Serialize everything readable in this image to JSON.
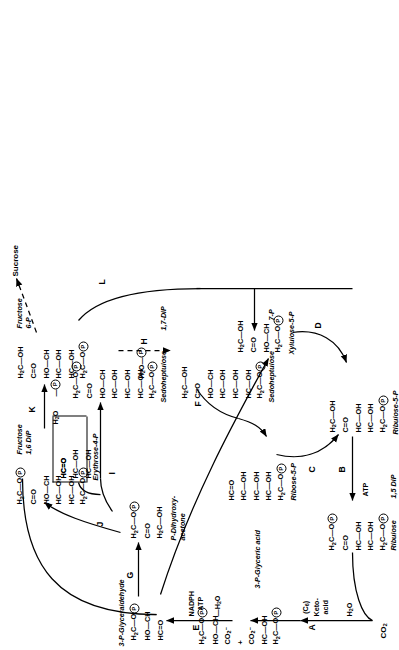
{
  "figure": {
    "orientation": "rotated-90-ccw"
  },
  "inputs": {
    "co2": "CO₂",
    "sucrose": "Sucrose"
  },
  "steps": {
    "a": "A",
    "b": "B",
    "c": "C",
    "d": "D",
    "e": "E",
    "f": "F",
    "g": "G",
    "h": "H",
    "i": "I",
    "j": "J",
    "k": "K",
    "l": "L"
  },
  "cofactors": {
    "a_intermediate": "(C₆)\nKeto-\nacid",
    "a_water": "H₂O",
    "b_atp": "ATP",
    "e_reductant": "NADPH\nATP",
    "e_water": "—H₂O",
    "h_water": "H₂O",
    "h_phosphate": "—Ⓟ",
    "k_water": "H₂O",
    "k_phosphate": "—Ⓟ"
  },
  "molecules": [
    {
      "id": "ribulose-1-5-dip",
      "name": "Ribulose\n1,5 DiP",
      "name_line1": "Ribulose",
      "name_line2": "1,5 DiP",
      "rows": [
        "H₂C—OⓅ",
        "C=O",
        "HC—OH",
        "HC—OH",
        "H₂C—OⓅ"
      ]
    },
    {
      "id": "3-p-glyceric-acid",
      "name": "3-P-Glyceric acid",
      "rows": [
        "H₂C—OⓅ",
        "HO—CH",
        "CO₂⁻",
        "+",
        "CO₂⁻",
        "HC—OH",
        "H₂C—OⓅ"
      ]
    },
    {
      "id": "3-p-glyceraldehyde",
      "name": "3-P-Glyceraldehyde",
      "rows": [
        "H₂C—OⓅ",
        "HO—CH",
        "HC=O"
      ]
    },
    {
      "id": "p-dihydroxyacetone",
      "name": "P-Dihydroxy-\nacetone",
      "name_line1": "P-Dihydroxy-",
      "name_line2": "acetone",
      "rows": [
        "H₂C—OⓅ",
        "C=O",
        "H₂C—OH"
      ]
    },
    {
      "id": "fructose-1-6-dip",
      "name": "Fructose\n1,6 DiP",
      "name_line1": "Fructose",
      "name_line2": "1,6 DiP",
      "rows": [
        "H₂C—OⓅ",
        "C=O",
        "HO—CH",
        "HC—OH",
        "HC—OH",
        "H₂C—OⓅ"
      ]
    },
    {
      "id": "fructose-6-p",
      "name": "Fructose\n6-P",
      "name_line1": "Fructose",
      "name_line2": "6-P",
      "rows": [
        "H₂C—OH",
        "C=O",
        "HO—CH",
        "HC—OH",
        "HC—OH",
        "H₂C—OⓅ"
      ]
    },
    {
      "id": "erythrose-4-p",
      "name": "Erythrose-4-P",
      "rows": [
        "HC=O",
        "HC—OH",
        "HC—OH",
        "H₂C—OⓅ"
      ]
    },
    {
      "id": "sedoheptulose-1-7-dip",
      "name": "Sedoheptulose\n1,7-DiP",
      "name_line1": "Sedoheptulose",
      "name_line2": "1,7-DiP",
      "rows": [
        "H₂C—OⓅ",
        "C=O",
        "HO—CH",
        "HC—OH",
        "HC—OH",
        "HC—OH",
        "H₂C—OⓅ"
      ]
    },
    {
      "id": "sedoheptulose-7-p",
      "name": "Sedoheptulose\n7-P",
      "name_line1": "Sedoheptulose",
      "name_line2": "7-P",
      "rows": [
        "H₂C—OH",
        "C=O",
        "HO—CH",
        "HC—OH",
        "HC—OH",
        "HC—OH",
        "H₂C—OⓅ"
      ]
    },
    {
      "id": "ribose-5-p",
      "name": "Ribose-5-P",
      "rows": [
        "HC=O",
        "HC—OH",
        "HC—OH",
        "HC—OH",
        "H₂C—OⓅ"
      ]
    },
    {
      "id": "xylulose-5-p",
      "name": "Xylulose-5-P",
      "rows": [
        "H₂C—OH",
        "C=O",
        "HO—CH",
        "H₂C—OⓅ"
      ]
    },
    {
      "id": "ribulose-5-p",
      "name": "Ribulose-5-P",
      "rows": [
        "H₂C—OH",
        "C=O",
        "HC—OH",
        "HC—OH",
        "H₂C—OⓅ"
      ]
    }
  ]
}
